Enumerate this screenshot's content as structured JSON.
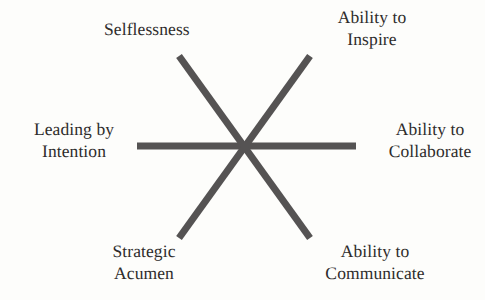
{
  "figure": {
    "type": "radial-star-diagram",
    "background_color": "#fdfdfb",
    "stroke_color": "#555353",
    "text_color": "#2e2c2b",
    "center": {
      "x": 244,
      "y": 146
    },
    "spoke_count": 6,
    "nodes": [
      {
        "id": "selflessness",
        "label": "Selflessness",
        "position": "top-left",
        "angle_deg": 120
      },
      {
        "id": "ability-to-inspire",
        "label": "Ability to\nInspire",
        "position": "top-right",
        "angle_deg": 60
      },
      {
        "id": "leading-by-intention",
        "label": "Leading by\nIntention",
        "position": "left",
        "angle_deg": 180
      },
      {
        "id": "ability-to-collaborate",
        "label": "Ability to\nCollaborate",
        "position": "right",
        "angle_deg": 0
      },
      {
        "id": "strategic-acumen",
        "label": "Strategic\nAcumen",
        "position": "bottom-left",
        "angle_deg": 240
      },
      {
        "id": "ability-to-communicate",
        "label": "Ability to\nCommunicate",
        "position": "bottom-right",
        "angle_deg": 300
      }
    ],
    "strokes": [
      {
        "id": "horizontal-spoke",
        "x1": 137,
        "y1": 146,
        "x2": 356,
        "y2": 146,
        "width": 7
      },
      {
        "id": "diagonal-spoke-nw-se",
        "x1": 179,
        "y1": 56,
        "x2": 310,
        "y2": 238,
        "width": 7
      },
      {
        "id": "diagonal-spoke-ne-sw",
        "x1": 310,
        "y1": 56,
        "x2": 179,
        "y2": 238,
        "width": 7
      }
    ]
  }
}
